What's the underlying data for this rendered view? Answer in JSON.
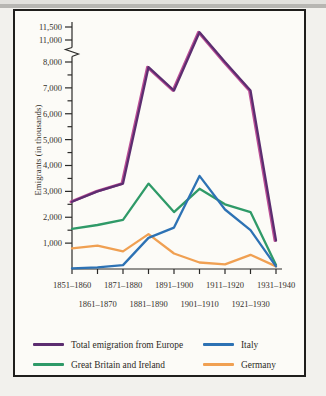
{
  "figure_background": "#fcfbf7",
  "page_background": "#f2f1ed",
  "axis_color": "#2b2a28",
  "text_color": "#33302b",
  "y_axis_title": "Emigrants (in thousands)",
  "chart_data": {
    "type": "line",
    "title": "",
    "xlabel": "",
    "ylabel": "Emigrants (in thousands)",
    "categories": [
      "1851–1860",
      "1861–1870",
      "1871–1880",
      "1881–1890",
      "1891–1900",
      "1901–1910",
      "1911–1920",
      "1921–1930",
      "1931–1940"
    ],
    "series": [
      {
        "name": "Total emigration from Europe",
        "color": "#5c2d70",
        "print_fringe_color": "#bc4f96",
        "values": [
          2600,
          3000,
          3300,
          7800,
          6900,
          11300,
          8000,
          6900,
          1100
        ]
      },
      {
        "name": "Great Britain and Ireland",
        "color": "#2f9a68",
        "values": [
          1550,
          1700,
          1900,
          3300,
          2200,
          3100,
          2500,
          2200,
          150
        ]
      },
      {
        "name": "Italy",
        "color": "#2d72b4",
        "values": [
          25,
          60,
          150,
          1200,
          1600,
          3600,
          2300,
          1500,
          100
        ]
      },
      {
        "name": "Germany",
        "color": "#f0a052",
        "values": [
          800,
          900,
          680,
          1350,
          600,
          250,
          180,
          550,
          100
        ]
      }
    ],
    "y_axis": {
      "ylim": [
        0,
        11500
      ],
      "break_between": [
        8000,
        11000
      ],
      "major_ticks": [
        {
          "value": 1000,
          "label": "1,000"
        },
        {
          "value": 2000,
          "label": "2,000"
        },
        {
          "value": 3000,
          "label": "3,000"
        },
        {
          "value": 4000,
          "label": "4,000"
        },
        {
          "value": 5000,
          "label": "5,000"
        },
        {
          "value": 6000,
          "label": "6,000"
        },
        {
          "value": 7000,
          "label": "7,000"
        },
        {
          "value": 8000,
          "label": "8,000"
        },
        {
          "value": 11000,
          "label": "11,000"
        },
        {
          "value": 11500,
          "label": "11,500"
        }
      ],
      "minor_ticks": [
        1500,
        2500,
        3500,
        4500,
        5500,
        6500,
        7500
      ]
    },
    "grid": false,
    "legend_position": "bottom"
  },
  "legend": {
    "items": [
      {
        "label": "Total emigration from Europe",
        "series_index": 0
      },
      {
        "label": "Italy",
        "series_index": 2
      },
      {
        "label": "Great Britain and Ireland",
        "series_index": 1
      },
      {
        "label": "Germany",
        "series_index": 3
      }
    ]
  }
}
